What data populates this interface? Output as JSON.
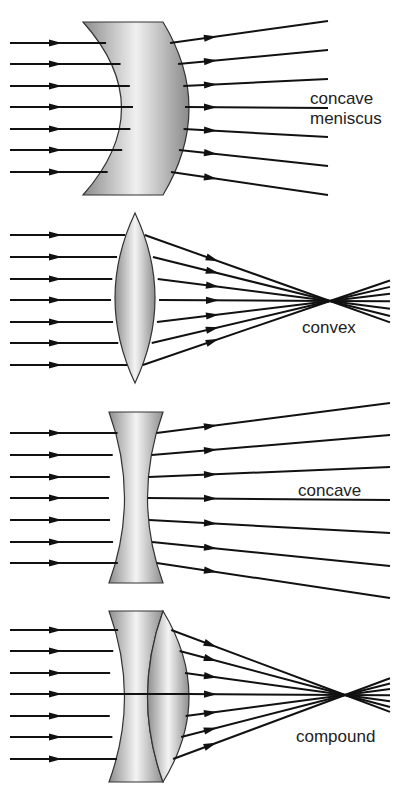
{
  "panels": [
    {
      "id": "concave-meniscus",
      "label_lines": [
        "concave",
        "meniscus"
      ],
      "ray_count": 7
    },
    {
      "id": "convex",
      "label_lines": [
        "convex"
      ],
      "ray_count": 7
    },
    {
      "id": "concave",
      "label_lines": [
        "concave"
      ],
      "ray_count": 7
    },
    {
      "id": "compound",
      "label_lines": [
        "compound"
      ],
      "ray_count": 7
    }
  ],
  "colors": {
    "ray": "#111111",
    "lens_dark": "#8a8a8a",
    "lens_light": "#f2f2f2",
    "text": "#222222"
  }
}
